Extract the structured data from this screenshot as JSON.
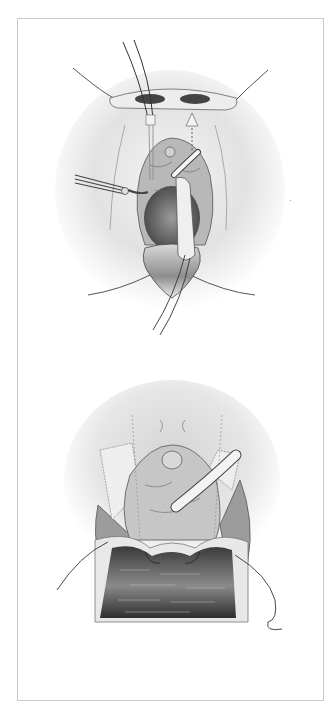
{
  "figure": {
    "type": "medical-illustration",
    "panels": [
      {
        "id": "top",
        "depiction": "surgical-field-with-retractor-and-catheter",
        "icons": [
          "forceps-icon",
          "catheter-icon",
          "suture-icon",
          "arrow-up-icon"
        ]
      },
      {
        "id": "bottom",
        "depiction": "tissue-flap-with-sutures-and-catheter",
        "icons": [
          "catheter-icon",
          "suture-icon"
        ]
      }
    ],
    "colors": {
      "border": "#c9c9c9",
      "shade_light": "#e6e6e6",
      "shade_mid": "#b5b5b5",
      "shade_dark": "#555555",
      "line": "#333333"
    }
  }
}
